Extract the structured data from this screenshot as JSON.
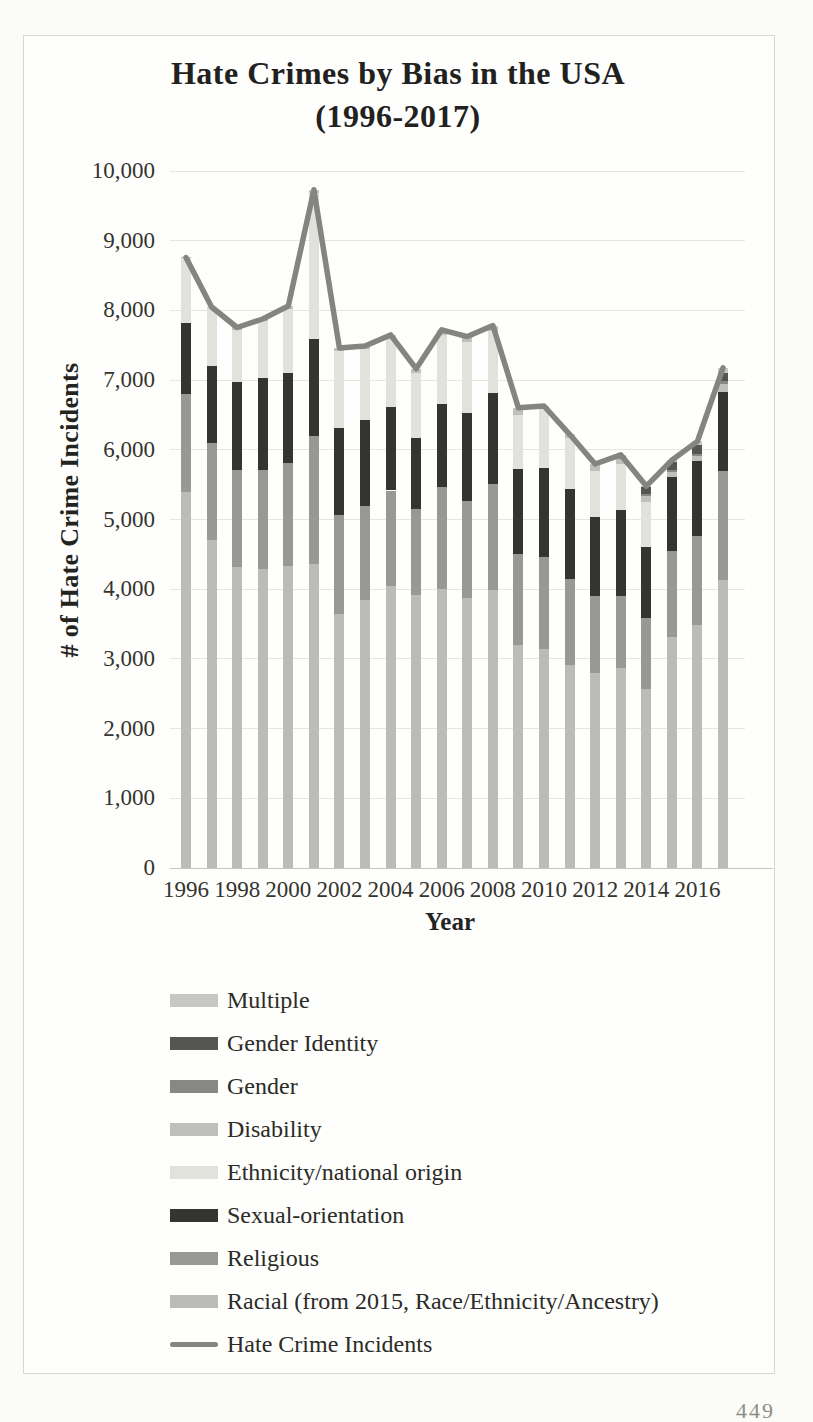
{
  "page": {
    "page_number": "449"
  },
  "figure": {
    "title": "Hate Crimes by Bias in the USA",
    "subtitle": "(1996-2017)"
  },
  "chart_data": {
    "type": "bar",
    "variant": "stacked-bars-with-total-line",
    "title": "Hate Crimes by Bias in the USA",
    "subtitle": "(1996-2017)",
    "xlabel": "Year",
    "ylabel": "# of Hate Crime Incidents",
    "ylim": [
      0,
      10000
    ],
    "ytick_interval": 1000,
    "ytick_labels": [
      "0",
      "1,000",
      "2,000",
      "3,000",
      "4,000",
      "5,000",
      "6,000",
      "7,000",
      "8,000",
      "9,000",
      "10,000"
    ],
    "xtick_labels": [
      "1996",
      "1998",
      "2000",
      "2002",
      "2004",
      "2006",
      "2008",
      "2010",
      "2012",
      "2014",
      "2016"
    ],
    "grid": true,
    "legend_position": "bottom-left",
    "categories": [
      1996,
      1997,
      1998,
      1999,
      2000,
      2001,
      2002,
      2003,
      2004,
      2005,
      2006,
      2007,
      2008,
      2009,
      2010,
      2011,
      2012,
      2013,
      2014,
      2015,
      2016,
      2017
    ],
    "series": [
      {
        "name": "Racial (from 2015, Race/Ethnicity/Ancestry)",
        "color": "#bbbbb7",
        "values": [
          5396,
          4710,
          4321,
          4295,
          4337,
          4367,
          3642,
          3844,
          4042,
          3919,
          4000,
          3870,
          3992,
          3199,
          3135,
          2917,
          2797,
          2871,
          2568,
          3310,
          3489,
          4131
        ]
      },
      {
        "name": "Religious",
        "color": "#989894",
        "values": [
          1401,
          1385,
          1390,
          1411,
          1472,
          1828,
          1426,
          1343,
          1374,
          1227,
          1462,
          1400,
          1519,
          1303,
          1322,
          1233,
          1099,
          1031,
          1014,
          1244,
          1273,
          1564
        ]
      },
      {
        "name": "Sexual-orientation",
        "color": "#343431",
        "values": [
          1016,
          1102,
          1260,
          1317,
          1299,
          1393,
          1244,
          1239,
          1197,
          1017,
          1195,
          1265,
          1297,
          1223,
          1277,
          1293,
          1135,
          1233,
          1017,
          1053,
          1076,
          1130
        ]
      },
      {
        "name": "Ethnicity/national origin",
        "color": "#e2e2dd",
        "values": [
          940,
          836,
          754,
          829,
          911,
          2098,
          1102,
          1026,
          972,
          944,
          984,
          1007,
          894,
          777,
          847,
          720,
          667,
          655,
          648,
          0,
          0,
          0
        ]
      },
      {
        "name": "Disability",
        "color": "#bfbfbb",
        "values": [
          6,
          12,
          25,
          19,
          36,
          35,
          45,
          33,
          57,
          53,
          79,
          79,
          78,
          96,
          43,
          53,
          92,
          83,
          84,
          74,
          70,
          116
        ]
      },
      {
        "name": "Gender",
        "color": "#878783",
        "values": [
          0,
          0,
          0,
          0,
          0,
          0,
          0,
          0,
          0,
          0,
          0,
          0,
          0,
          0,
          0,
          0,
          0,
          18,
          33,
          23,
          31,
          46
        ]
      },
      {
        "name": "Gender Identity",
        "color": "#555552",
        "values": [
          0,
          0,
          0,
          0,
          0,
          0,
          0,
          0,
          0,
          0,
          0,
          0,
          0,
          0,
          0,
          0,
          0,
          31,
          98,
          114,
          124,
          119
        ]
      },
      {
        "name": "Multiple",
        "color": "#c7c7c3",
        "values": [
          0,
          4,
          5,
          5,
          8,
          9,
          3,
          4,
          7,
          3,
          2,
          3,
          3,
          6,
          4,
          6,
          6,
          6,
          17,
          32,
          58,
          69
        ]
      }
    ],
    "line_series": {
      "name": "Hate Crime Incidents",
      "color": "#848480",
      "values": [
        8759,
        8049,
        7755,
        7876,
        8063,
        9730,
        7462,
        7489,
        7649,
        7163,
        7722,
        7624,
        7783,
        6604,
        6628,
        6222,
        5796,
        5928,
        5479,
        5850,
        6121,
        7175
      ]
    }
  },
  "legend": {
    "items": [
      {
        "label": "Multiple",
        "swatch": "box",
        "color": "#c7c7c3"
      },
      {
        "label": "Gender Identity",
        "swatch": "box",
        "color": "#555552"
      },
      {
        "label": "Gender",
        "swatch": "box",
        "color": "#878783"
      },
      {
        "label": "Disability",
        "swatch": "box",
        "color": "#bfbfbb"
      },
      {
        "label": "Ethnicity/national origin",
        "swatch": "box",
        "color": "#e2e2dd"
      },
      {
        "label": "Sexual-orientation",
        "swatch": "box",
        "color": "#343431"
      },
      {
        "label": "Religious",
        "swatch": "box",
        "color": "#989894"
      },
      {
        "label": "Racial (from 2015, Race/Ethnicity/Ancestry)",
        "swatch": "box",
        "color": "#bbbbb7"
      },
      {
        "label": "Hate Crime Incidents",
        "swatch": "line",
        "color": "#848480"
      }
    ]
  }
}
